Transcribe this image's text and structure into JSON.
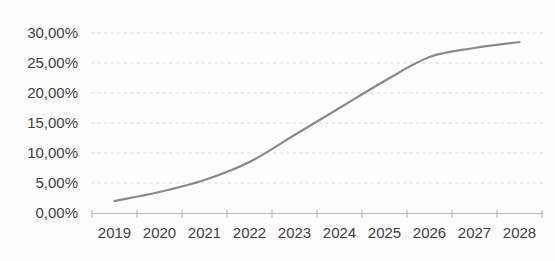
{
  "chart_data": {
    "type": "line",
    "title": "",
    "xlabel": "",
    "ylabel": "",
    "categories": [
      "2019",
      "2020",
      "2021",
      "2022",
      "2023",
      "2024",
      "2025",
      "2026",
      "2027",
      "2028"
    ],
    "values": [
      2.0,
      3.5,
      5.5,
      8.5,
      13.0,
      17.5,
      22.0,
      26.0,
      27.5,
      28.5
    ],
    "unit": "%",
    "ylim": [
      0,
      30
    ],
    "ytick_step": 5,
    "ytick_labels": [
      "0,00%",
      "5,00%",
      "10,00%",
      "15,00%",
      "20,00%",
      "25,00%",
      "30,00%"
    ],
    "grid": "horizontal-dashed",
    "legend": "none",
    "series": [
      {
        "name": "adoption-rate",
        "values": [
          2.0,
          3.5,
          5.5,
          8.5,
          13.0,
          17.5,
          22.0,
          26.0,
          27.5,
          28.5
        ]
      }
    ]
  },
  "colors": {
    "series_line": "#8a8a8a",
    "gridline": "#d9d9d9",
    "axis_line": "#bdbdbd",
    "tick_label": "#3f3f3f",
    "background": "#fefefe"
  }
}
